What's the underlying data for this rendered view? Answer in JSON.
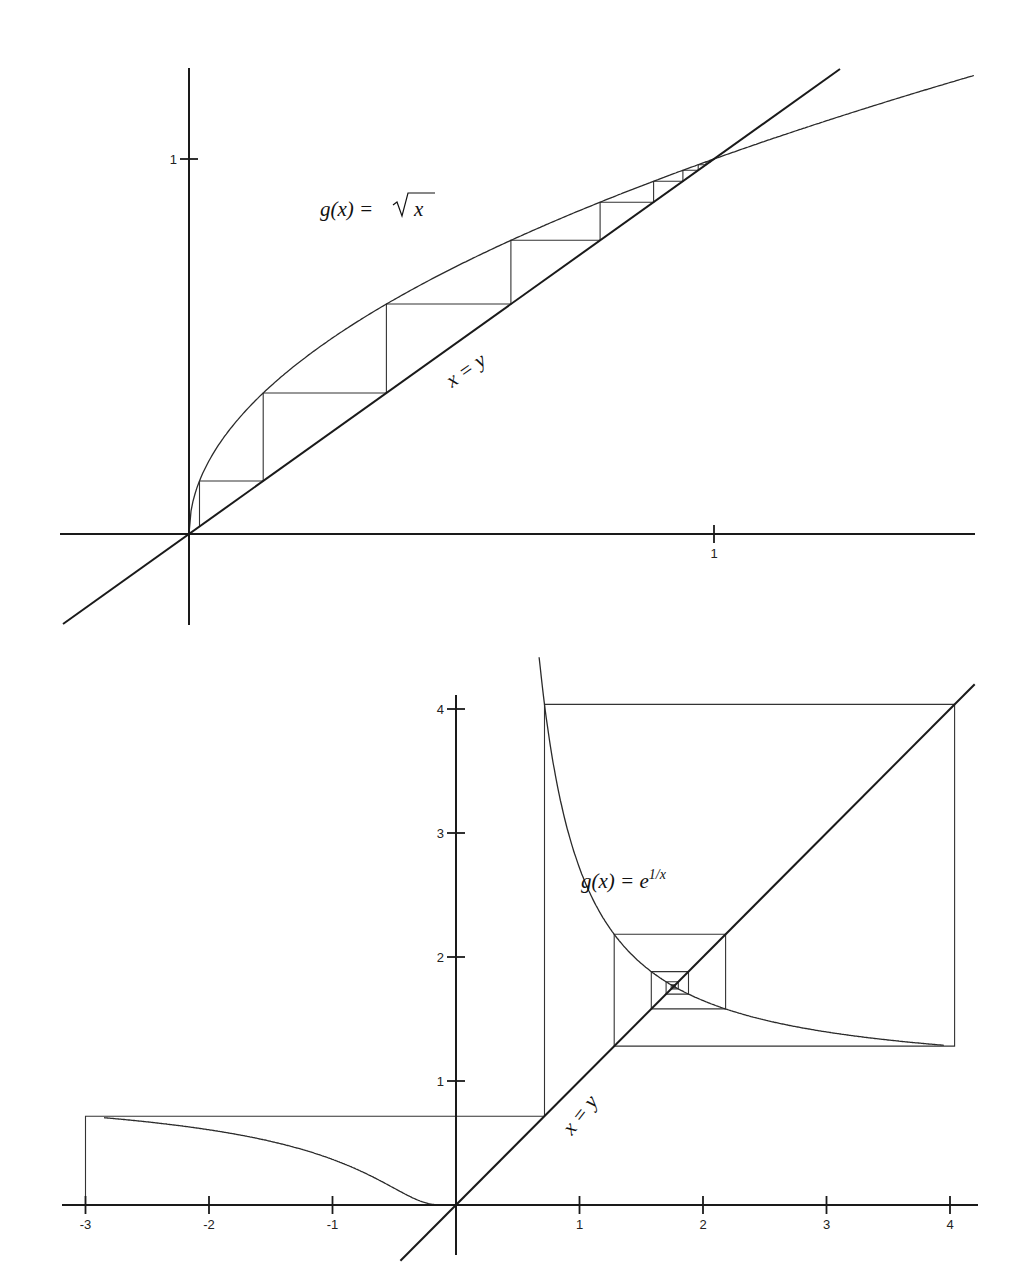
{
  "chart_data": [
    {
      "type": "line",
      "title": "Fixed-point iteration (cobweb) for g(x) = sqrt(x)",
      "function_label": "g(x) = √x",
      "function_label_parts": {
        "lhs": "g(x) = ",
        "radicand": "x"
      },
      "diagonal_label": "x = y",
      "xlabel": "",
      "ylabel": "",
      "x_ticks": [
        1
      ],
      "x_tick_labels": [
        "1"
      ],
      "y_ticks": [
        1
      ],
      "y_tick_labels": [
        "1"
      ],
      "xlim": [
        -0.245,
        1.495
      ],
      "ylim": [
        -0.245,
        1.375
      ],
      "grid": false,
      "series": [
        {
          "name": "g(x) = sqrt(x)",
          "x": [
            0,
            0.01,
            0.05,
            0.1,
            0.2,
            0.3,
            0.4,
            0.5,
            0.6,
            0.7,
            0.8,
            0.9,
            1.0,
            1.2,
            1.5
          ],
          "y": [
            0,
            0.1,
            0.224,
            0.316,
            0.447,
            0.548,
            0.632,
            0.707,
            0.775,
            0.837,
            0.894,
            0.949,
            1.0,
            1.095,
            1.225
          ]
        },
        {
          "name": "x = y",
          "x": [
            -0.24,
            1.24
          ],
          "y": [
            -0.24,
            1.24
          ]
        },
        {
          "name": "cobweb iterates",
          "x0": 0.02,
          "iterates": [
            0.02,
            0.141,
            0.376,
            0.613,
            0.783,
            0.885,
            0.941,
            0.97,
            0.985,
            0.992,
            0.996,
            0.998,
            1.0
          ]
        }
      ],
      "fixed_point": [
        1,
        1
      ]
    },
    {
      "type": "line",
      "title": "Fixed-point iteration (cobweb) for g(x) = e^(1/x)",
      "function_label": "g(x) = e^(1/x)",
      "function_label_parts": {
        "lhs": "g(x) = e",
        "exponent": "1/x"
      },
      "diagonal_label": "x = y",
      "xlabel": "",
      "ylabel": "",
      "x_ticks": [
        -3,
        -2,
        -1,
        1,
        2,
        3,
        4
      ],
      "x_tick_labels": [
        "-3",
        "-2",
        "-1",
        "1",
        "2",
        "3",
        "4"
      ],
      "y_ticks": [
        1,
        2,
        3,
        4
      ],
      "y_tick_labels": [
        "1",
        "2",
        "3",
        "4"
      ],
      "xlim": [
        -3.2,
        4.2
      ],
      "ylim": [
        -0.4,
        4.4
      ],
      "grid": false,
      "series": [
        {
          "name": "g(x) = e^(1/x), x<0",
          "x": [
            -3.2,
            -3,
            -2.5,
            -2,
            -1.5,
            -1,
            -0.75,
            -0.5,
            -0.35,
            -0.25,
            -0.15
          ],
          "y": [
            0.732,
            0.717,
            0.67,
            0.607,
            0.513,
            0.368,
            0.264,
            0.135,
            0.057,
            0.018,
            0.001
          ]
        },
        {
          "name": "g(x) = e^(1/x), x>0",
          "x": [
            0.67,
            0.7,
            0.75,
            0.8,
            0.9,
            1.0,
            1.2,
            1.5,
            1.763,
            2.0,
            2.5,
            3.0,
            3.5,
            4.0,
            4.2
          ],
          "y": [
            4.45,
            4.17,
            3.79,
            3.49,
            3.04,
            2.72,
            2.3,
            1.95,
            1.763,
            1.65,
            1.49,
            1.4,
            1.33,
            1.28,
            1.27
          ]
        },
        {
          "name": "x = y",
          "x": [
            -0.45,
            4.2
          ],
          "y": [
            -0.45,
            4.2
          ]
        },
        {
          "name": "cobweb iterates",
          "x0": -3,
          "iterates": [
            -3,
            0.717,
            4.03,
            1.28,
            2.18,
            1.58,
            1.88,
            1.7,
            1.8,
            1.74,
            1.78,
            1.76,
            1.763
          ]
        }
      ],
      "fixed_point": [
        1.763,
        1.763
      ]
    }
  ]
}
